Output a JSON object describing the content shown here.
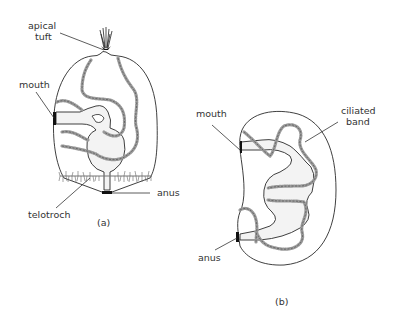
{
  "figure": {
    "panel_a": {
      "caption": "(a)",
      "labels": {
        "apical_tuft_line1": "apical",
        "apical_tuft_line2": "tuft",
        "mouth": "mouth",
        "anus": "anus",
        "telotroch": "telotroch"
      }
    },
    "panel_b": {
      "caption": "(b)",
      "labels": {
        "mouth": "mouth",
        "ciliated_band_line1": "ciliated",
        "ciliated_band_line2": "band",
        "anus": "anus"
      }
    }
  }
}
